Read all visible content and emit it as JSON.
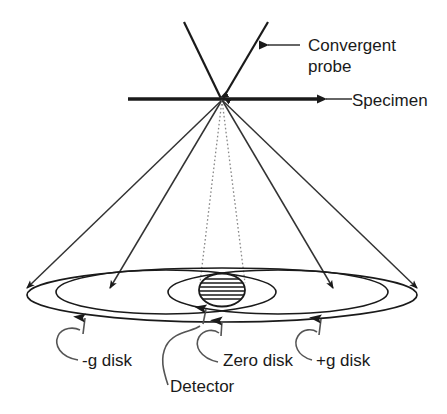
{
  "figure": {
    "kind": "schematic-diagram",
    "background_color": "#ffffff",
    "line_color": "#1a1a1a",
    "text_color": "#1a1a1a"
  },
  "labels": {
    "convergent_probe_line1": "Convergent",
    "convergent_probe_line2": "probe",
    "specimen": "Specimen",
    "minus_g_disk": "-g disk",
    "detector": "Detector",
    "zero_disk": "Zero disk",
    "plus_g_disk": "+g disk"
  },
  "annotations": {
    "probe_arrow": "arrow-left",
    "specimen_arrow": "arrow-left",
    "minus_g_arrow": "arrow-up-curved",
    "detector_arrow": "arrow-up-curved",
    "zero_disk_arrow": "arrow-up-curved",
    "plus_g_arrow": "arrow-up-curved"
  },
  "geometry": {
    "apex_x": 222,
    "apex_y": 99,
    "specimen_line_x1": 128,
    "specimen_line_x2": 322,
    "specimen_line_y": 99,
    "outer_ellipse_cx": 222,
    "outer_ellipse_cy": 295,
    "outer_ellipse_rx": 200,
    "outer_ellipse_ry": 26,
    "left_ellipse_cx": 158,
    "right_ellipse_cx": 286,
    "inner_ellipse_rx": 132,
    "inner_ellipse_ry": 22,
    "detector_cx": 222,
    "detector_cy": 290,
    "detector_rx": 24,
    "detector_ry": 17
  }
}
